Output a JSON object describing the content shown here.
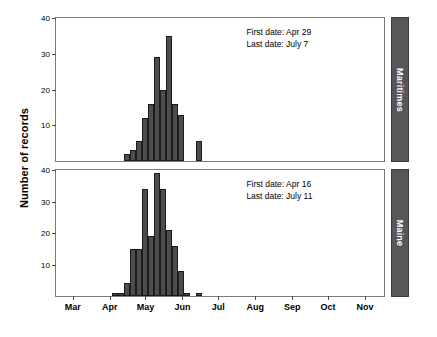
{
  "chart_data": {
    "type": "bar",
    "title": "",
    "subtitle": "",
    "xlabel": "",
    "ylabel": "Number of records",
    "ylim": [
      0,
      40
    ],
    "yticks": [
      0,
      10,
      20,
      30,
      40
    ],
    "ytick_labels": [
      "",
      "10",
      "20",
      "30",
      "40"
    ],
    "xlim": [
      0,
      275
    ],
    "xticks": [
      14,
      45,
      75,
      106,
      136,
      167,
      198,
      228,
      259
    ],
    "xtick_labels": [
      "Mar",
      "Apr",
      "May",
      "Jun",
      "Jul",
      "Aug",
      "Sep",
      "Oct",
      "Nov"
    ],
    "grid": false,
    "legend": "none",
    "bar_color": "#4d4d4d",
    "bar_edge_color": "#1c1c1c",
    "strip_color": "#575757",
    "strip_text_color": "#ffffff",
    "frame_color": "#7a7a7a",
    "panels": [
      {
        "id": "maritimes",
        "strip_label": "Maritimes",
        "annotations": [
          "First date: Apr 29",
          "Last date: July 7"
        ],
        "first_date": "Apr 29",
        "last_date": "July 7",
        "ylim": [
          0,
          40
        ],
        "bars": [
          {
            "x": 57,
            "label": "Apr 26",
            "value": 2
          },
          {
            "x": 62,
            "label": "May 1",
            "value": 3
          },
          {
            "x": 67,
            "label": "May 6",
            "value": 5.5
          },
          {
            "x": 72,
            "label": "May 11",
            "value": 12
          },
          {
            "x": 77,
            "label": "May 16",
            "value": 16
          },
          {
            "x": 82,
            "label": "May 21",
            "value": 29
          },
          {
            "x": 87,
            "label": "May 26",
            "value": 20
          },
          {
            "x": 92,
            "label": "May 31",
            "value": 35
          },
          {
            "x": 97,
            "label": "Jun 5",
            "value": 16
          },
          {
            "x": 102,
            "label": "Jun 10",
            "value": 13
          },
          {
            "x": 117,
            "label": "Jun 25",
            "value": 5.5
          }
        ]
      },
      {
        "id": "maine",
        "strip_label": "Maine",
        "annotations": [
          "First date: Apr 16",
          "Last date: July 11"
        ],
        "first_date": "Apr 16",
        "last_date": "July 11",
        "ylim": [
          0,
          40
        ],
        "bars": [
          {
            "x": 47,
            "label": "Apr 16",
            "value": 1
          },
          {
            "x": 52,
            "label": "Apr 21",
            "value": 1
          },
          {
            "x": 57,
            "label": "Apr 26",
            "value": 4
          },
          {
            "x": 62,
            "label": "May 1",
            "value": 15
          },
          {
            "x": 67,
            "label": "May 6",
            "value": 15
          },
          {
            "x": 72,
            "label": "May 11",
            "value": 34
          },
          {
            "x": 77,
            "label": "May 16",
            "value": 19
          },
          {
            "x": 82,
            "label": "May 21",
            "value": 39
          },
          {
            "x": 87,
            "label": "May 26",
            "value": 34
          },
          {
            "x": 92,
            "label": "May 31",
            "value": 21
          },
          {
            "x": 97,
            "label": "Jun 5",
            "value": 16
          },
          {
            "x": 102,
            "label": "Jun 10",
            "value": 8
          },
          {
            "x": 107,
            "label": "Jun 15",
            "value": 1
          },
          {
            "x": 117,
            "label": "Jun 25",
            "value": 1
          }
        ]
      }
    ]
  }
}
